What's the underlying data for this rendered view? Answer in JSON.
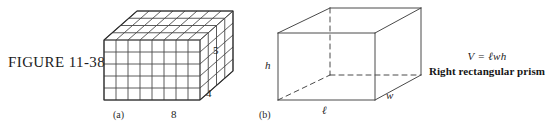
{
  "figure": {
    "number_label": "FIGURE 11-38",
    "background_color": "#ffffff",
    "line_color": "#3a3a3a"
  },
  "part_a": {
    "part_label": "(a)",
    "description": "unit-cube-stack",
    "width_label": "8",
    "height_label": "5",
    "depth_label": "4",
    "units_width": 8,
    "units_height": 5,
    "units_depth": 4
  },
  "part_b": {
    "part_label": "(b)",
    "description": "right-rectangular-prism-wireframe",
    "length_label": "ℓ",
    "width_label": "w",
    "height_label": "h",
    "formula": "V = ℓwh",
    "caption": "Right rectangular prism"
  }
}
